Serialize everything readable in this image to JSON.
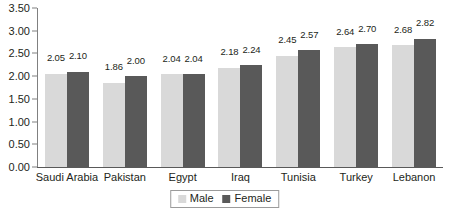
{
  "chart_data": {
    "type": "bar",
    "title": "",
    "subtitle": "",
    "xlabel": "",
    "ylabel": "",
    "categories": [
      "Saudi Arabia",
      "Pakistan",
      "Egypt",
      "Iraq",
      "Tunisia",
      "Turkey",
      "Lebanon"
    ],
    "series": [
      {
        "name": "Male",
        "color": "#d9d9d9",
        "values": [
          2.05,
          1.86,
          2.04,
          2.18,
          2.45,
          2.64,
          2.68
        ],
        "labels": [
          "2.05",
          "1.86",
          "2.04",
          "2.18",
          "2.45",
          "2.64",
          "2.68"
        ]
      },
      {
        "name": "Female",
        "color": "#595959",
        "values": [
          2.1,
          2.0,
          2.04,
          2.24,
          2.57,
          2.7,
          2.82
        ],
        "labels": [
          "2.10",
          "2.00",
          "2.04",
          "2.24",
          "2.57",
          "2.70",
          "2.82"
        ]
      }
    ],
    "ylim": [
      0.0,
      3.5
    ],
    "ytick_values": [
      0.0,
      0.5,
      1.0,
      1.5,
      2.0,
      2.5,
      3.0,
      3.5
    ],
    "ytick_labels": [
      "0.00",
      "0.50",
      "1.00",
      "1.50",
      "2.00",
      "2.50",
      "3.00",
      "3.50"
    ],
    "grid": false,
    "data_labels": true,
    "legend": {
      "position": "bottom",
      "bordered": true,
      "entries": [
        {
          "label": "Male",
          "color": "#d9d9d9"
        },
        {
          "label": "Female",
          "color": "#595959"
        }
      ]
    },
    "axis_color": "#808080",
    "text_color": "#231f20",
    "background": "#ffffff"
  }
}
